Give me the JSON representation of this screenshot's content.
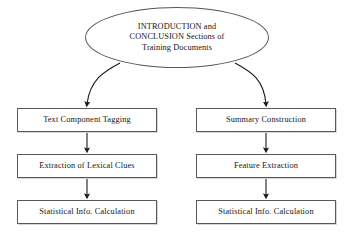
{
  "diagram": {
    "type": "flowchart",
    "background_color": "#ffffff",
    "line_color": "#1a1a1a",
    "box_border_color": "#58585a",
    "text_color": "#151515",
    "root": {
      "shape": "ellipse",
      "lines": [
        "INTRODUCTION and",
        "CONCLUSION Sections of",
        "Training Documents"
      ]
    },
    "branches": [
      {
        "name": "left-branch",
        "steps": [
          {
            "label": "Text Component Tagging"
          },
          {
            "label": "Extraction of Lexical Clues"
          },
          {
            "label": "Statistical Info. Calculation"
          }
        ]
      },
      {
        "name": "right-branch",
        "steps": [
          {
            "label": "Summary Construction"
          },
          {
            "label": "Feature Extraction"
          },
          {
            "label": "Statistical Info. Calculation"
          }
        ]
      }
    ]
  }
}
